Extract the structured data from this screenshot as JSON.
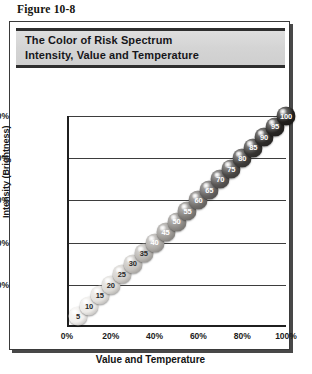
{
  "figure": {
    "caption": "Figure 10-8"
  },
  "panel": {
    "title_line1": "The Color of Risk Spectrum",
    "title_line2": "Intensity, Value and Temperature"
  },
  "chart_data": {
    "type": "scatter",
    "title": "The Color of Risk Spectrum Intensity, Value and Temperature",
    "xlabel": "Value and Temperature",
    "ylabel": "Intensity (Brightness)",
    "xlim": [
      0,
      100
    ],
    "ylim": [
      0,
      100
    ],
    "grid": true,
    "legend": null,
    "xticklabels": [
      "0%",
      "20%",
      "40%",
      "60%",
      "80%",
      "100%"
    ],
    "xtickvalues": [
      0,
      20,
      40,
      60,
      80,
      100
    ],
    "yticklabels": [
      "20%",
      "40%",
      "60%",
      "80%",
      "100%"
    ],
    "ytickvalues": [
      20,
      40,
      60,
      80,
      100
    ],
    "point_labels": [
      "5",
      "10",
      "15",
      "20",
      "25",
      "30",
      "35",
      "40",
      "45",
      "50",
      "55",
      "60",
      "65",
      "70",
      "75",
      "80",
      "85",
      "90",
      "95",
      "100"
    ],
    "x": [
      5,
      10,
      15,
      20,
      25,
      30,
      35,
      40,
      45,
      50,
      55,
      60,
      65,
      70,
      75,
      80,
      85,
      90,
      95,
      100
    ],
    "y": [
      5,
      10,
      15,
      20,
      25,
      30,
      35,
      40,
      45,
      50,
      55,
      60,
      65,
      70,
      75,
      80,
      85,
      90,
      95,
      100
    ],
    "marker_fills": [
      "#f2f0ee",
      "#eceae7",
      "#e4e2df",
      "#dcdad6",
      "#d2cfcb",
      "#c6c3bf",
      "#b9b6b2",
      "#aba8a4",
      "#9c9995",
      "#8e8b87",
      "#807d79",
      "#726f6c",
      "#646160",
      "#575453",
      "#4a4846",
      "#3f3d3b",
      "#363432",
      "#2e2c2a",
      "#282624",
      "#201e1c"
    ],
    "marker_text_colors": [
      "#2a2a2a",
      "#2a2a2a",
      "#2a2a2a",
      "#2a2a2a",
      "#2a2a2a",
      "#2a2a2a",
      "#2a2a2a",
      "#ffffff",
      "#ffffff",
      "#ffffff",
      "#ffffff",
      "#ffffff",
      "#ffffff",
      "#ffffff",
      "#ffffff",
      "#ffffff",
      "#ffffff",
      "#ffffff",
      "#ffffff",
      "#ffffff"
    ]
  }
}
